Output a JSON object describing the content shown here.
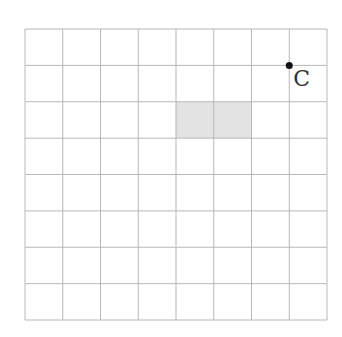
{
  "diagram": {
    "type": "grid",
    "rows": 8,
    "cols": 8,
    "bounds": {
      "left": 25,
      "top": 29,
      "right": 327,
      "bottom": 320
    },
    "grid_color": "#b8b8b8",
    "shaded_region": {
      "row": 2,
      "col_start": 4,
      "col_end": 6,
      "fill": "#e3e3e3"
    },
    "points": [
      {
        "label": "C",
        "grid_x": 7,
        "grid_y": 1,
        "color": "#111111"
      }
    ]
  }
}
